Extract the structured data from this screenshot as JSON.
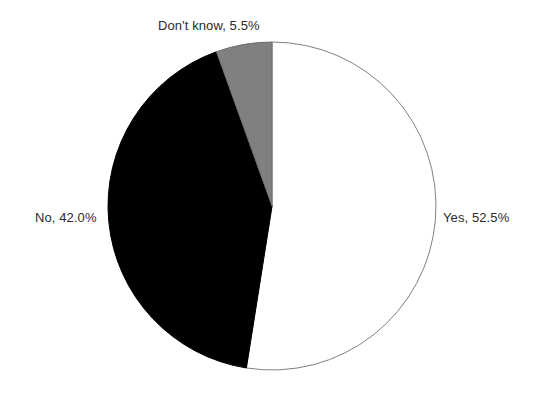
{
  "chart_data": {
    "type": "pie",
    "title": "",
    "subtitle": "",
    "xlabel": "",
    "ylabel": "",
    "legend_position": "none",
    "grid": false,
    "labels_outside": true,
    "start_angle_deg": 0,
    "direction": "clockwise",
    "categories": [
      "Yes",
      "No",
      "Don't know"
    ],
    "values": [
      52.5,
      42.0,
      5.5
    ],
    "value_unit": "%",
    "slices": [
      {
        "name": "Yes",
        "value": 52.5,
        "value_text": "52.5%",
        "label": "Yes, 52.5%",
        "color": "#ffffff",
        "edge_color": "#808080",
        "start_angle_deg": 0,
        "end_angle_deg": 189
      },
      {
        "name": "No",
        "value": 42.0,
        "value_text": "42.0%",
        "label": "No, 42.0%",
        "color": "#000000",
        "edge_color": "#000000",
        "start_angle_deg": 189,
        "end_angle_deg": 340.2
      },
      {
        "name": "Don't know",
        "value": 5.5,
        "value_text": "5.5%",
        "label": "Don't know, 5.5%",
        "color": "#808080",
        "edge_color": "#6e6e6e",
        "start_angle_deg": 340.2,
        "end_angle_deg": 360
      }
    ],
    "geometry": {
      "center_x": 272,
      "center_y": 206,
      "radius": 164
    },
    "colors": {
      "background": "#ffffff",
      "text": "#2b2b2b",
      "outline": "#808080",
      "slice_yes": "#ffffff",
      "slice_no": "#000000",
      "slice_dontknow": "#808080"
    }
  }
}
